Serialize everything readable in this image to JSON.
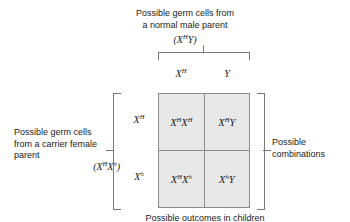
{
  "diagram": {
    "title_top": "Possible germ cells from\na normal male parent",
    "genotype_top": "(X<sup>H</sup>Y)",
    "title_left": "Possible germ cells\nfrom a carrier female\nparent",
    "genotype_left": "(X<sup>H</sup>X<sup>h</sup>)",
    "title_right": "Possible\ncombinations",
    "caption_bottom": "Possible outcomes in children"
  },
  "grid": {
    "column_headers": [
      "X<sup>H</sup>",
      "Y"
    ],
    "row_headers": [
      "X<sup>H</sup>",
      "X<sup>h</sup>"
    ],
    "cells": [
      [
        "X<sup>H</sup>X<sup>H</sup>",
        "X<sup>H</sup>Y"
      ],
      [
        "X<sup>H</sup>X<sup>h</sup>",
        "X<sup>h</sup>Y"
      ]
    ]
  },
  "colors": {
    "cell_fill": "#e8e8e8",
    "grid_line": "#8a8a8a",
    "bracket": "#7a7a7a",
    "text": "#1a1a1a",
    "background": "#ffffff"
  }
}
